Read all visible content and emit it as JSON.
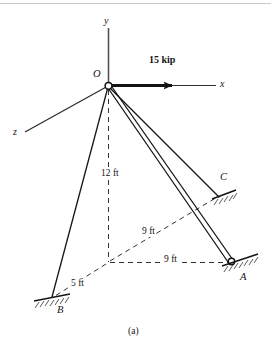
{
  "figure": {
    "caption": "(a)",
    "axes": [
      {
        "name": "y-axis",
        "label": "y"
      },
      {
        "name": "x-axis",
        "label": "x"
      },
      {
        "name": "z-axis",
        "label": "z"
      }
    ],
    "points": [
      {
        "name": "origin",
        "label": "O"
      },
      {
        "name": "support-a",
        "label": "A"
      },
      {
        "name": "support-b",
        "label": "B"
      },
      {
        "name": "support-c",
        "label": "C"
      }
    ],
    "force": {
      "label": "15 kip",
      "magnitude": 15,
      "unit": "kip",
      "direction": "x"
    },
    "dimensions": [
      {
        "name": "vertical-height",
        "label": "12 ft",
        "value": 12,
        "unit": "ft"
      },
      {
        "name": "diagonal-to-c",
        "label": "9 ft",
        "value": 9,
        "unit": "ft"
      },
      {
        "name": "horizontal-to-a",
        "label": "9 ft",
        "value": 9,
        "unit": "ft"
      },
      {
        "name": "diagonal-to-b",
        "label": "5 ft",
        "value": 5,
        "unit": "ft"
      }
    ],
    "colors": {
      "ink": "#141414",
      "line": "#1a1a1a",
      "dashed": "#303030",
      "hatch": "#555555",
      "background": "#ffffff"
    }
  }
}
